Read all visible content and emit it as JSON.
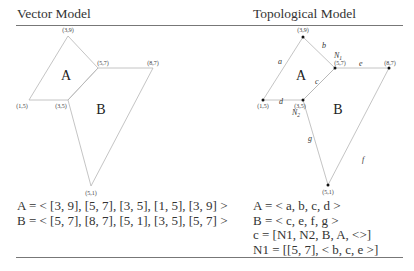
{
  "panels": {
    "vector": {
      "title": "Vector Model",
      "vertices": [
        {
          "label": "(3,9)",
          "x": 68,
          "y": 36
        },
        {
          "label": "(5,7)",
          "x": 98,
          "y": 68
        },
        {
          "label": "(8,7)",
          "x": 153,
          "y": 68
        },
        {
          "label": "(1,5)",
          "x": 29,
          "y": 100
        },
        {
          "label": "(3,5)",
          "x": 68,
          "y": 100
        },
        {
          "label": "(5,1)",
          "x": 91,
          "y": 186
        }
      ],
      "regions": [
        {
          "label": "A"
        },
        {
          "label": "B"
        }
      ],
      "equations": [
        "A = < [3, 9], [5, 7], [3, 5], [1, 5], [3, 9] >",
        "B = < [5, 7], [8, 7], [5, 1], [3, 5], [5, 7] >"
      ]
    },
    "topological": {
      "title": "Topological Model",
      "vertices": [
        {
          "label": "(3,9)",
          "x": 303,
          "y": 37
        },
        {
          "label": "(5,7)",
          "x": 335,
          "y": 68
        },
        {
          "label": "(8,7)",
          "x": 389,
          "y": 68
        },
        {
          "label": "(1,5)",
          "x": 263,
          "y": 100
        },
        {
          "label": "(3,5)",
          "x": 303,
          "y": 100
        },
        {
          "label": "(5,1)",
          "x": 328,
          "y": 185
        }
      ],
      "regions": [
        {
          "label": "A"
        },
        {
          "label": "B"
        }
      ],
      "edges": [
        "a",
        "b",
        "c",
        "d",
        "e",
        "f",
        "g"
      ],
      "nodes": [
        "N1",
        "N2"
      ],
      "equations": [
        "A = < a, b, c, d >",
        "B = < c, e, f, g >",
        "c = [N1, N2, B, A, <>]",
        "N1 = [[5, 7], < b, c, e >]"
      ]
    }
  }
}
